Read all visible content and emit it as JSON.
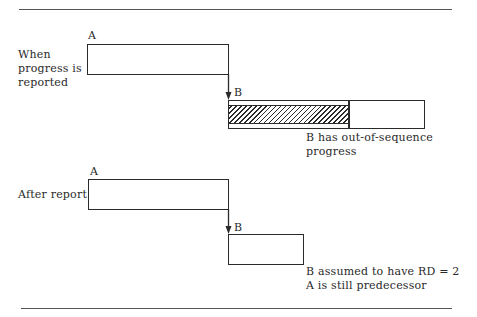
{
  "diagram": {
    "panels": [
      {
        "row_label_lines": [
          "When",
          "progress is",
          "reported"
        ],
        "activity_a": {
          "label": "A"
        },
        "activity_b": {
          "label": "B",
          "has_hatched_progress": true
        },
        "caption_lines": [
          "B has out-of-sequence",
          "progress"
        ]
      },
      {
        "row_label_lines": [
          "After report"
        ],
        "activity_a": {
          "label": "A"
        },
        "activity_b": {
          "label": "B",
          "has_hatched_progress": false
        },
        "caption_lines": [
          "B assumed to have RD = 2",
          "A is still predecessor"
        ]
      }
    ]
  }
}
